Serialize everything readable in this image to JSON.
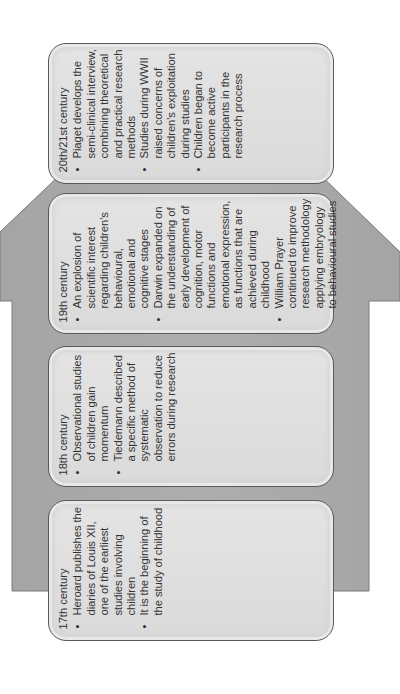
{
  "colors": {
    "arrow_fill": "#a9a9a9",
    "arrow_stroke": "#7a7a7a",
    "box_fill": "#dedede",
    "box_stroke": "#5a5a5a",
    "text": "#333333"
  },
  "diagram": {
    "type": "timeline-arrow",
    "direction": "up (content rotated -90°)",
    "stages": [
      {
        "title": "17th century",
        "bullets": [
          "Heroard publishes the diaries of Louis XII, one of the earliest studies involving children",
          "It is the beginning of the study of childhood"
        ]
      },
      {
        "title": "18th century",
        "bullets": [
          "Observational studies of children gain momentum",
          "Tiedemann described a specific method of systematic observation to reduce errors during research"
        ]
      },
      {
        "title": "19th century",
        "bullets": [
          "An explosion of scientific interest regarding children's behavioural, emotional and cognitive stages",
          "Darwin expanded on the understanding of early development of cognition, motor functions and emotional expression, as functions that are achieved during childhood",
          "William Prayer continued to improve research methodology applying embryology to behavioural studies"
        ]
      },
      {
        "title": "20th/21st century",
        "bullets": [
          "Piaget develops the semi-clinical interview, combining theoretical and practical research methods",
          "Studies during WWII raised concerns of children's exploitation during studies",
          "Children began to become active participants in the research process"
        ]
      }
    ]
  }
}
